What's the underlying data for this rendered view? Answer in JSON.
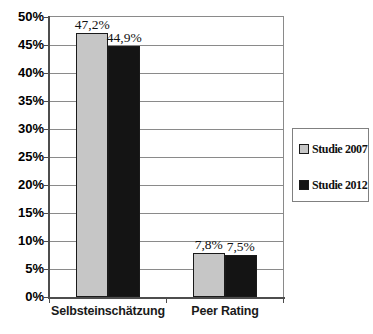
{
  "chart_data": {
    "type": "bar",
    "title": "",
    "xlabel": "",
    "ylabel": "",
    "categories": [
      "Selbsteinschätzung",
      "Peer Rating"
    ],
    "series": [
      {
        "name": "Studie 2007",
        "values": [
          47.2,
          7.8
        ],
        "labels": [
          "47,2%",
          "7,8%"
        ],
        "color": "#c6c6c6"
      },
      {
        "name": "Studie 2012",
        "values": [
          44.9,
          7.5
        ],
        "labels": [
          "44,9%",
          "7,5%"
        ],
        "color": "#141414"
      }
    ],
    "y_axis": {
      "min": 0,
      "max": 50,
      "step": 5,
      "tick_values": [
        50,
        45,
        40,
        35,
        30,
        25,
        20,
        15,
        10,
        5,
        0
      ],
      "tick_labels": [
        "50%",
        "45%",
        "40%",
        "35%",
        "30%",
        "25%",
        "20%",
        "15%",
        "10%",
        "5%",
        "0%"
      ]
    },
    "grid": true,
    "legend_position": "right",
    "colors": {
      "grid": "#8a8a8a",
      "axis": "#4d4d4d",
      "bar_border": "#1a1a1a",
      "legend_border": "#808080",
      "background": "#ffffff"
    }
  }
}
